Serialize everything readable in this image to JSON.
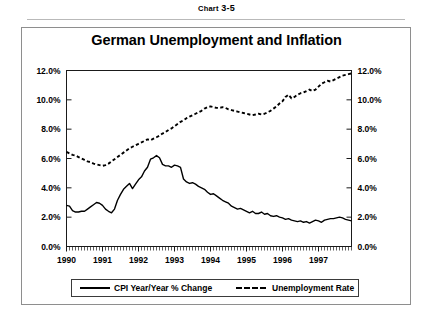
{
  "figure": {
    "number_prefix": "Chart",
    "number": "3-5",
    "title": "German Unemployment and Inflation"
  },
  "chart_data": {
    "type": "line",
    "title": "German Unemployment and Inflation",
    "xlabel": "",
    "ylabel": "",
    "ylabel_right": "",
    "ylim": [
      0,
      12
    ],
    "xlim": [
      1990.0,
      1997.92
    ],
    "grid": false,
    "legend_position": "bottom",
    "ytick_labels": [
      "0.0%",
      "2.0%",
      "4.0%",
      "6.0%",
      "8.0%",
      "10.0%",
      "12.0%"
    ],
    "ytick_values": [
      0,
      2,
      4,
      6,
      8,
      10,
      12
    ],
    "ytick_labels_right": [
      "0.0%",
      "2.0%",
      "4.0%",
      "6.0%",
      "8.0%",
      "10.0%",
      "12.0%"
    ],
    "xtick_labels": [
      "1990",
      "1991",
      "1992",
      "1993",
      "1994",
      "1995",
      "1996",
      "1997"
    ],
    "xtick_values": [
      1990,
      1991,
      1992,
      1993,
      1994,
      1995,
      1996,
      1997
    ],
    "minor_xticks": "monthly",
    "series": [
      {
        "name": "CPI Year/Year % Change",
        "style": "solid",
        "color": "#000000",
        "values": [
          2.8,
          2.75,
          2.45,
          2.35,
          2.35,
          2.4,
          2.4,
          2.55,
          2.7,
          2.85,
          3.0,
          2.95,
          2.8,
          2.55,
          2.4,
          2.3,
          2.55,
          3.15,
          3.55,
          3.9,
          4.1,
          4.3,
          3.95,
          4.25,
          4.55,
          4.75,
          5.15,
          5.4,
          5.95,
          6.05,
          6.2,
          6.05,
          5.6,
          5.5,
          5.5,
          5.4,
          5.55,
          5.5,
          5.4,
          4.6,
          4.4,
          4.3,
          4.35,
          4.25,
          4.1,
          4.0,
          3.9,
          3.7,
          3.55,
          3.6,
          3.45,
          3.3,
          3.15,
          3.05,
          2.95,
          2.75,
          2.65,
          2.55,
          2.6,
          2.5,
          2.4,
          2.3,
          2.4,
          2.25,
          2.25,
          2.35,
          2.2,
          2.25,
          2.1,
          2.05,
          2.1,
          2.0,
          1.95,
          1.85,
          1.9,
          1.8,
          1.75,
          1.7,
          1.75,
          1.65,
          1.7,
          1.6,
          1.7,
          1.8,
          1.75,
          1.65,
          1.8,
          1.85,
          1.9,
          1.9,
          1.95,
          2.0,
          1.95,
          1.85,
          1.8,
          1.75
        ]
      },
      {
        "name": "Unemployment Rate",
        "style": "dashed",
        "color": "#000000",
        "values": [
          6.45,
          6.35,
          6.25,
          6.2,
          6.1,
          6.0,
          5.9,
          5.8,
          5.75,
          5.65,
          5.6,
          5.55,
          5.5,
          5.55,
          5.65,
          5.8,
          5.95,
          6.1,
          6.25,
          6.4,
          6.55,
          6.7,
          6.8,
          6.9,
          7.0,
          7.1,
          7.2,
          7.3,
          7.25,
          7.35,
          7.45,
          7.55,
          7.7,
          7.8,
          7.95,
          8.05,
          8.2,
          8.35,
          8.5,
          8.6,
          8.75,
          8.85,
          8.95,
          9.05,
          9.15,
          9.25,
          9.4,
          9.5,
          9.55,
          9.5,
          9.45,
          9.45,
          9.5,
          9.45,
          9.35,
          9.3,
          9.25,
          9.2,
          9.15,
          9.1,
          9.05,
          9.0,
          8.95,
          9.0,
          9.05,
          9.0,
          9.05,
          9.15,
          9.25,
          9.4,
          9.55,
          9.75,
          9.9,
          10.2,
          10.35,
          10.1,
          10.2,
          10.35,
          10.45,
          10.5,
          10.6,
          10.7,
          10.6,
          10.7,
          10.9,
          11.1,
          11.2,
          11.3,
          11.25,
          11.35,
          11.45,
          11.55,
          11.65,
          11.7,
          11.75,
          11.8
        ]
      }
    ]
  },
  "legend": {
    "entries": [
      {
        "label": "CPI Year/Year % Change",
        "style": "solid"
      },
      {
        "label": "Unemployment Rate",
        "style": "dashed"
      }
    ]
  }
}
